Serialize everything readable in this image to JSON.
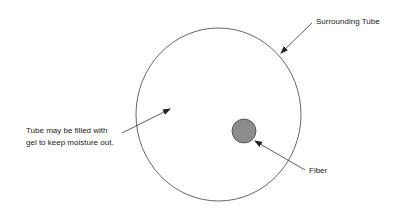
{
  "diagram": {
    "type": "cross-section",
    "labels": {
      "tube": "Surrounding Tube",
      "gel_line1": "Tube may be filled with",
      "gel_line2": "gel to keep moisture out.",
      "fiber": "Fiber"
    },
    "colors": {
      "outline": "#555555",
      "fiber_fill": "#8c8c8c",
      "text": "#222222"
    }
  }
}
